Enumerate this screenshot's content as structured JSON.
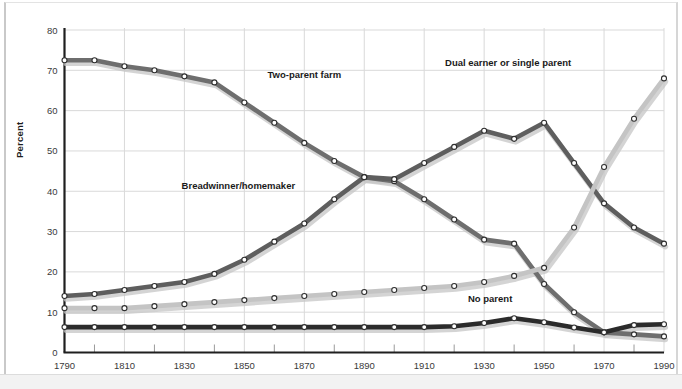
{
  "chart_data": {
    "type": "line",
    "title": "",
    "subtitle": "",
    "xlabel": "",
    "ylabel": "Percent",
    "xlim": [
      1790,
      1990
    ],
    "ylim": [
      0,
      80
    ],
    "yticks": [
      0,
      10,
      20,
      30,
      40,
      50,
      60,
      70,
      80
    ],
    "xticks_labeled": [
      1790,
      1810,
      1830,
      1850,
      1870,
      1890,
      1910,
      1930,
      1950,
      1970,
      1990
    ],
    "xticks_minor": [
      1800,
      1820,
      1840,
      1860,
      1880,
      1900,
      1920,
      1940,
      1960,
      1980
    ],
    "grid": true,
    "legend": "inline-annotations",
    "x": [
      1790,
      1800,
      1810,
      1820,
      1830,
      1840,
      1850,
      1860,
      1870,
      1880,
      1890,
      1900,
      1910,
      1920,
      1930,
      1940,
      1950,
      1960,
      1970,
      1980,
      1990
    ],
    "series": [
      {
        "name": "Two-parent farm",
        "color": "#6e6e6e",
        "label_x": 1870,
        "label_y": 68,
        "values": [
          72.5,
          72.5,
          71,
          70,
          68.5,
          67,
          62,
          57,
          52,
          47.5,
          43.5,
          42.5,
          38,
          33,
          28,
          27,
          17,
          10,
          5,
          4.5,
          4
        ]
      },
      {
        "name": "Breadwinner/homemaker",
        "color": "#5e5e5e",
        "label_x": 1848,
        "label_y": 40.5,
        "values": [
          14,
          14.5,
          15.5,
          16.5,
          17.5,
          19.5,
          23,
          27.5,
          32,
          38,
          43.5,
          43,
          47,
          51,
          55,
          53,
          57,
          47,
          37,
          31,
          27
        ]
      },
      {
        "name": "Dual earner or single parent",
        "color": "#c4c4c4",
        "label_x": 1938,
        "label_y": 71,
        "values": [
          11,
          11,
          11,
          11.5,
          12,
          12.5,
          13,
          13.5,
          14,
          14.5,
          15,
          15.5,
          16,
          16.5,
          17.5,
          19,
          21,
          31,
          46,
          58,
          68
        ]
      },
      {
        "name": "No parent",
        "color": "#2b2b2b",
        "label_x": 1932,
        "label_y": 12.5,
        "values": [
          6.3,
          6.3,
          6.3,
          6.3,
          6.3,
          6.3,
          6.3,
          6.3,
          6.3,
          6.3,
          6.3,
          6.3,
          6.3,
          6.5,
          7.3,
          8.5,
          7.5,
          6.2,
          5,
          6.8,
          7
        ]
      }
    ]
  },
  "axis": {
    "y_title": "Percent",
    "y_tick_labels": [
      "0",
      "10",
      "20",
      "30",
      "40",
      "50",
      "60",
      "70",
      "80"
    ],
    "x_tick_labels": [
      "1790",
      "1810",
      "1830",
      "1850",
      "1870",
      "1890",
      "1910",
      "1930",
      "1950",
      "1970",
      "1990"
    ]
  },
  "annotations": [
    {
      "text": "Two-parent farm",
      "name": "label-two-parent-farm"
    },
    {
      "text": "Dual earner or single parent",
      "name": "label-dual-earner"
    },
    {
      "text": "Breadwinner/homemaker",
      "name": "label-breadwinner"
    },
    {
      "text": "No parent",
      "name": "label-no-parent"
    }
  ],
  "colors": {
    "two_parent_farm": "#6e6e6e",
    "breadwinner": "#5e5e5e",
    "dual_earner": "#c4c4c4",
    "no_parent": "#2b2b2b",
    "grid": "#d9d9d9",
    "axis": "#1f1f1f",
    "background": "#ffffff"
  }
}
